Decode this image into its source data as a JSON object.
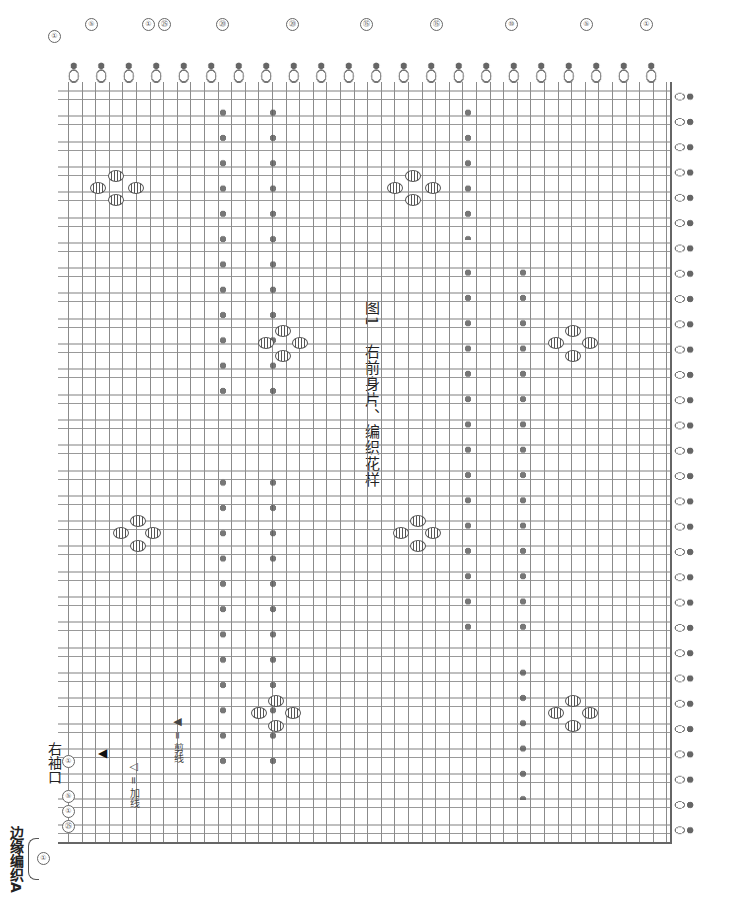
{
  "title": {
    "figure": "图1",
    "text": "右前身片、编织花样"
  },
  "labels": {
    "sleeve_opening": "右袖口",
    "edging": "边缘编织A"
  },
  "legend": [
    {
      "symbol": "◁",
      "meaning": "= 加线"
    },
    {
      "symbol": "◀",
      "meaning": "= 剪线"
    }
  ],
  "row_markers_top": [
    "①",
    "⑤",
    "①",
    "㉕",
    "⑳",
    "⑮",
    "⑩",
    "⑤",
    "①"
  ],
  "row_markers_left": [
    "①",
    "⑤",
    "①",
    "㉕"
  ],
  "edge_marker_bottom": "①",
  "colors": {
    "ink": "#555555",
    "background": "#ffffff"
  }
}
